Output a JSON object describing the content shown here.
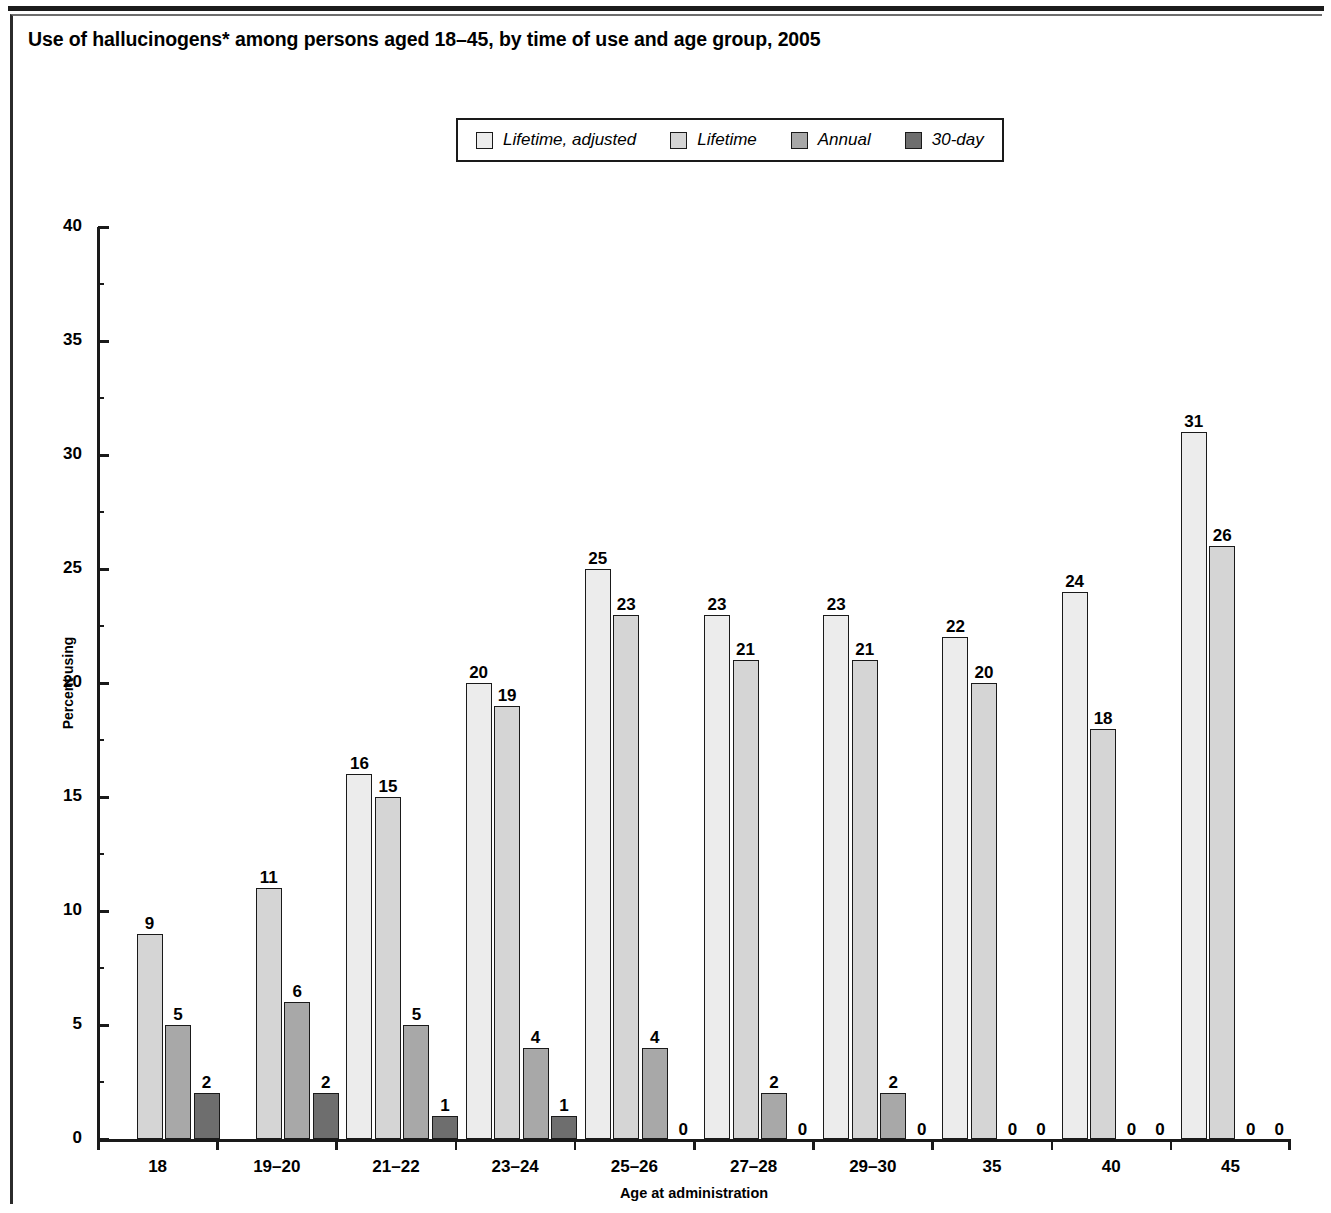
{
  "figure": {
    "title": "Use of hallucinogens* among persons aged 18–45, by time of use and age group, 2005",
    "xlabel": "Age at administration",
    "ylabel": "Percent using"
  },
  "legend": {
    "items": [
      {
        "label": "Lifetime, adjusted",
        "color": "#ececec"
      },
      {
        "label": "Lifetime",
        "color": "#d5d5d5"
      },
      {
        "label": "Annual",
        "color": "#a8a8a8"
      },
      {
        "label": "30-day",
        "color": "#6e6e6e"
      }
    ]
  },
  "yticks": [
    {
      "label": "40",
      "value": 40
    },
    {
      "label": "35",
      "value": 35
    },
    {
      "label": "30",
      "value": 30
    },
    {
      "label": "25",
      "value": 25
    },
    {
      "label": "20",
      "value": 20
    },
    {
      "label": "15",
      "value": 15
    },
    {
      "label": "10",
      "value": 10
    },
    {
      "label": "5",
      "value": 5
    },
    {
      "label": "0",
      "value": 0
    }
  ],
  "chart_data": {
    "type": "bar",
    "title": "Use of hallucinogens* among persons aged 18–45, by time of use and age group, 2005",
    "xlabel": "Age at administration",
    "ylabel": "Percent using",
    "ylim": [
      0,
      40
    ],
    "ytick_step": 5,
    "grid": false,
    "legend_position": "top-center",
    "categories": [
      "18",
      "19–20",
      "21–22",
      "23–24",
      "25–26",
      "27–28",
      "29–30",
      "35",
      "40",
      "45"
    ],
    "series": [
      {
        "name": "Lifetime, adjusted",
        "color": "#ececec",
        "values": [
          null,
          null,
          16,
          20,
          25,
          23,
          23,
          22,
          24,
          31
        ],
        "labels": [
          "",
          "",
          "16",
          "20",
          "25",
          "23",
          "23",
          "22",
          "24",
          "31"
        ]
      },
      {
        "name": "Lifetime",
        "color": "#d5d5d5",
        "values": [
          9,
          11,
          15,
          19,
          23,
          21,
          21,
          20,
          18,
          26
        ],
        "labels": [
          "9",
          "11",
          "15",
          "19",
          "23",
          "21",
          "21",
          "20",
          "18",
          "26"
        ]
      },
      {
        "name": "Annual",
        "color": "#a8a8a8",
        "values": [
          5,
          6,
          5,
          4,
          4,
          2,
          2,
          0,
          0,
          0
        ],
        "labels": [
          "5",
          "6",
          "5",
          "4",
          "4",
          "2",
          "2",
          "0",
          "0",
          "0"
        ]
      },
      {
        "name": "30-day",
        "color": "#6e6e6e",
        "values": [
          2,
          2,
          1,
          1,
          0,
          0,
          0,
          0,
          0,
          0
        ],
        "labels": [
          "2",
          "2",
          "1",
          "1",
          "0",
          "0",
          "0",
          "0",
          "0",
          "0"
        ]
      }
    ]
  }
}
